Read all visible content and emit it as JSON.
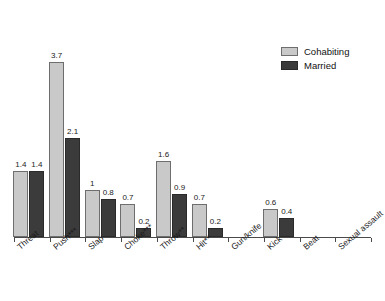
{
  "chart_data": {
    "type": "bar",
    "title": "",
    "subtitle": "",
    "xlabel": "",
    "ylabel": "",
    "grid": false,
    "legend_position": "top-right",
    "ylim": [
      0,
      4.0
    ],
    "categories": [
      "Threat",
      "Push***",
      "Slap",
      "Choke***",
      "Throw**",
      "Hit**",
      "Gun/knife",
      "Kick",
      "Beat",
      "Sexual assault"
    ],
    "series": [
      {
        "name": "Cohabiting",
        "color": "#c9c9c9",
        "values": [
          1.4,
          3.7,
          1,
          0.7,
          1.6,
          0.7,
          0,
          0.6,
          0,
          0
        ],
        "labels": [
          "1.4",
          "3.7",
          "1",
          "0.7",
          "1.6",
          "0.7",
          "",
          "0.6",
          "",
          ""
        ]
      },
      {
        "name": "Married",
        "color": "#3b3b3b",
        "values": [
          1.4,
          2.1,
          0.8,
          0.2,
          0.9,
          0.2,
          0,
          0.4,
          0,
          0
        ],
        "labels": [
          "1.4",
          "2.1",
          "0.8",
          "0.2",
          "0.9",
          "0.2",
          "",
          "0.4",
          "",
          ""
        ]
      }
    ]
  },
  "legend": {
    "items": [
      {
        "label": "Cohabiting",
        "swatch": "cohabiting"
      },
      {
        "label": "Married",
        "swatch": "married"
      }
    ]
  }
}
